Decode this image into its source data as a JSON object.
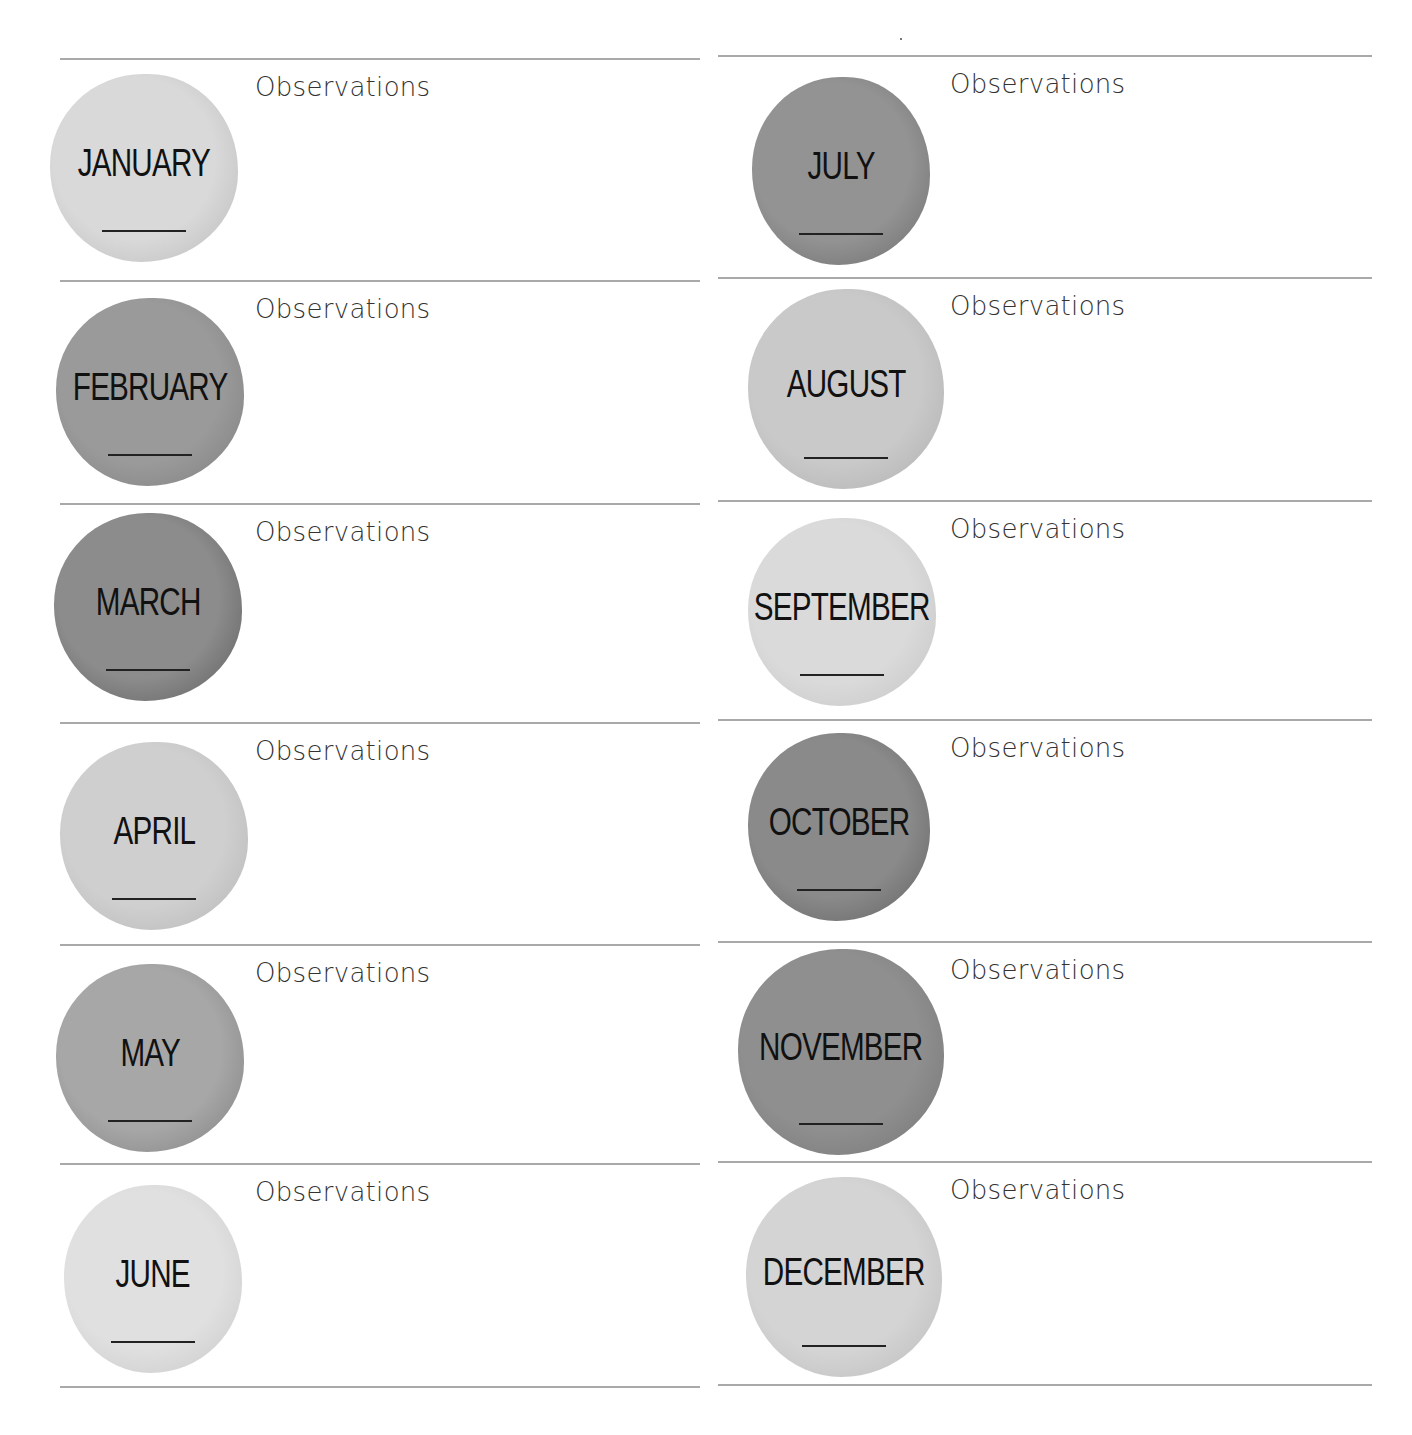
{
  "page": {
    "observations_label": "Observations",
    "left_column": [
      {
        "month": "JANUARY",
        "shade": "#d9d9d9",
        "edge": "#b8b8b8"
      },
      {
        "month": "FEBRUARY",
        "shade": "#9a9a9a",
        "edge": "#7d7d7d"
      },
      {
        "month": "MARCH",
        "shade": "#8c8c8c",
        "edge": "#5a5a5a"
      },
      {
        "month": "APRIL",
        "shade": "#cfcfcf",
        "edge": "#b3b3b3"
      },
      {
        "month": "MAY",
        "shade": "#a7a7a7",
        "edge": "#7e7e7e"
      },
      {
        "month": "JUNE",
        "shade": "#e0e0e0",
        "edge": "#c6c6c6"
      }
    ],
    "right_column": [
      {
        "month": "JULY",
        "shade": "#939393",
        "edge": "#6a6a6a"
      },
      {
        "month": "AUGUST",
        "shade": "#c9c9c9",
        "edge": "#adadad"
      },
      {
        "month": "SEPTEMBER",
        "shade": "#dadada",
        "edge": "#c2c2c2"
      },
      {
        "month": "OCTOBER",
        "shade": "#8a8a8a",
        "edge": "#5f5f5f"
      },
      {
        "month": "NOVEMBER",
        "shade": "#8f8f8f",
        "edge": "#737373"
      },
      {
        "month": "DECEMBER",
        "shade": "#d4d4d4",
        "edge": "#b9b9b9"
      }
    ]
  }
}
